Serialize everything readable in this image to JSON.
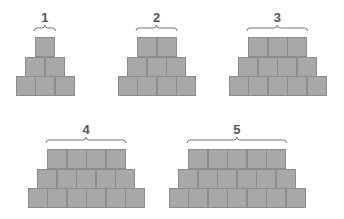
{
  "diagram": {
    "block_size": 20,
    "colors": {
      "block_fill": "#a8a8a8",
      "block_border": "#8c8c8c",
      "brace": "#777777",
      "label": "#555555",
      "background": "#ffffff"
    },
    "figures": [
      {
        "label": "1",
        "top_row": 1,
        "rows": [
          1,
          2,
          3
        ],
        "top_x": 35,
        "top_y": 37
      },
      {
        "label": "2",
        "top_row": 2,
        "rows": [
          2,
          3,
          4
        ],
        "top_x": 137,
        "top_y": 37
      },
      {
        "label": "3",
        "top_row": 3,
        "rows": [
          3,
          4,
          5
        ],
        "top_x": 248,
        "top_y": 37
      },
      {
        "label": "4",
        "top_row": 4,
        "rows": [
          4,
          5,
          6
        ],
        "top_x": 47,
        "top_y": 149
      },
      {
        "label": "5",
        "top_row": 5,
        "rows": [
          5,
          6,
          7
        ],
        "top_x": 188,
        "top_y": 149
      }
    ]
  }
}
